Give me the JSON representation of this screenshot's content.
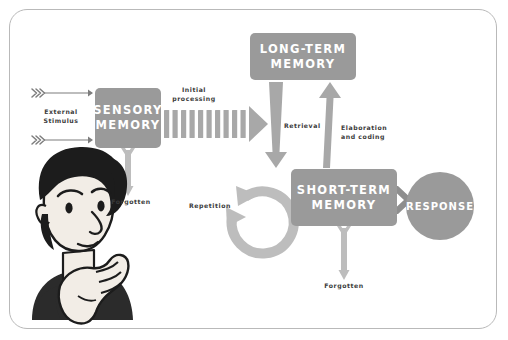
{
  "diagram": {
    "background_color": "#ffffff",
    "frame_color": "#b9b9b9",
    "box_color": "#9a9a9a",
    "arrow_color": "#b0b0b0",
    "label_color": "#3a3a3a",
    "box_text_color": "#ffffff"
  },
  "boxes": [
    {
      "id": "sensory",
      "line1": "SENSORY",
      "line2": "MEMORY"
    },
    {
      "id": "longterm",
      "line1": "LONG-TERM",
      "line2": "MEMORY"
    },
    {
      "id": "shortterm",
      "line1": "SHORT-TERM",
      "line2": "MEMORY"
    }
  ],
  "response": {
    "label": "RESPONSE"
  },
  "labels": {
    "external_stimulus_line1": "External",
    "external_stimulus_line2": "Stimulus",
    "initial_processing_line1": "Initial",
    "initial_processing_line2": "processing",
    "forgotten_sensory": "Forgotten",
    "retrieval": "Retrieval",
    "elaboration_line1": "Elaboration",
    "elaboration_line2": "and coding",
    "repetition": "Repetition",
    "forgotten_shortterm": "Forgotten"
  },
  "icons": {
    "thinking_person": "thinking-person-illustration",
    "stimulus_arrow": "chevron-tail-arrow-icon",
    "processing_arrow": "striped-arrow-icon",
    "retrieval_arrow": "down-arrow-icon",
    "elaboration_arrow": "up-arrow-icon",
    "forgotten_arrow": "thin-down-arrow-icon",
    "repetition_arrow": "circular-loop-arrow-icon",
    "response_arrows": "triple-chevron-icon"
  }
}
